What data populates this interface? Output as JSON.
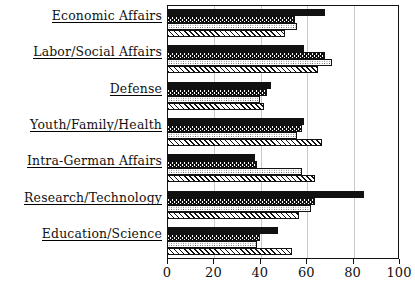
{
  "chart_data": {
    "type": "bar",
    "orientation": "horizontal",
    "title": "",
    "subtitle": "",
    "xlabel": "",
    "ylabel": "",
    "xlim": [
      0,
      100
    ],
    "ylim": null,
    "grid": true,
    "grid_axis": "x",
    "legend": false,
    "legend_position": "none",
    "categories": [
      "Economic Affairs",
      "Labor/Social Affairs",
      "Defense",
      "Youth/Family/Health",
      "Intra-German Affairs",
      "Research/Technology",
      "Education/Science"
    ],
    "xticks": [
      0,
      20,
      40,
      60,
      80,
      100
    ],
    "xticklabels": [
      "0",
      "20",
      "40",
      "60",
      "80",
      "100"
    ],
    "series": [
      {
        "name": "series-1",
        "pattern": "solid-black",
        "values": [
          68,
          59,
          45,
          59,
          38,
          85,
          48
        ]
      },
      {
        "name": "series-2",
        "pattern": "vertical-zigzag-hatch",
        "values": [
          55,
          68,
          43,
          58,
          39,
          64,
          40
        ]
      },
      {
        "name": "series-3",
        "pattern": "dotted-stipple",
        "values": [
          56,
          71,
          40,
          56,
          58,
          62,
          39
        ]
      },
      {
        "name": "series-4",
        "pattern": "diagonal-hatch",
        "values": [
          51,
          65,
          42,
          67,
          64,
          57,
          54
        ]
      }
    ],
    "colors": {
      "series_1_fill": "#111111",
      "series_2_fill": "#ffffff",
      "series_3_fill": "#ffffff",
      "series_4_fill": "#ffffff",
      "stroke": "#111111",
      "grid": "#c9c9c9",
      "background": "#ffffff"
    }
  }
}
